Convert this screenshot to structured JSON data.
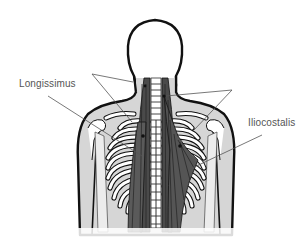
{
  "diagram": {
    "labels": [
      {
        "id": "longissimus",
        "text": "Longissimus"
      },
      {
        "id": "iliocostalis",
        "text": "Iliocostalis"
      }
    ],
    "colors": {
      "outline": "#111111",
      "body_fill": "#d6d6d6",
      "bone_fill": "#ffffff",
      "muscle_fill": "#4a4a4a",
      "leader_line": "#555555",
      "label_text": "#555555",
      "background": "#ffffff"
    }
  }
}
